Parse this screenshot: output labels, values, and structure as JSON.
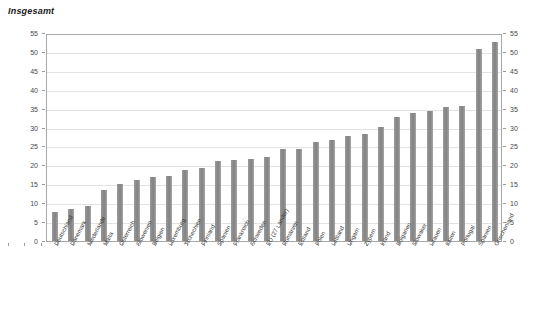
{
  "chart_data": {
    "type": "bar",
    "title": "Insgesamt",
    "xlabel": "",
    "ylabel": "",
    "ylim": [
      0,
      55
    ],
    "yticks": [
      0,
      5,
      10,
      15,
      20,
      25,
      30,
      35,
      40,
      45,
      50,
      55
    ],
    "grid": true,
    "legend": false,
    "bar_color": "#8d8d8d",
    "axis_color": "#a8a8a8",
    "gridline_color": "#e2e2e2",
    "categories": [
      "Deutschland",
      "Dänemark",
      "Niederlande",
      "Malta",
      "Österreich",
      "Slowenien",
      "Belgien",
      "Luxemburg",
      "Tschechien",
      "Finnland",
      "Spanien",
      "Frankreich",
      "Schweden",
      "EU (27 Länder)",
      "Rumänien",
      "Estland",
      "Polen",
      "Lettland",
      "Ungarn",
      "Zypern",
      "Irland",
      "Bulgarien",
      "Slowakei",
      "Litauen",
      "Italien",
      "Portugal",
      "Spanien",
      "Griechenland"
    ],
    "values": [
      7.8,
      8.5,
      9.3,
      13.5,
      15.0,
      16.1,
      16.8,
      17.1,
      18.8,
      19.2,
      21.2,
      21.5,
      21.6,
      22.2,
      24.3,
      24.4,
      26.2,
      26.7,
      27.9,
      28.4,
      30.2,
      32.8,
      33.9,
      34.3,
      35.5,
      35.6,
      50.8,
      52.5
    ]
  }
}
